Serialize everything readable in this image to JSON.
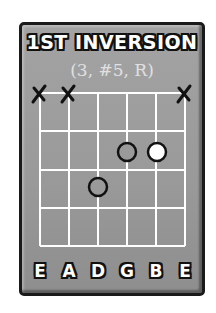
{
  "title": "1ST INVERSION",
  "subtitle": "(3, #5, R)",
  "colors": {
    "card": "#9e9e9e",
    "border": "#1a1a1a",
    "grid": "#ffffff",
    "root_fill": "#ffffff",
    "note_fill": "#9e9e9e"
  },
  "diagram": {
    "strings": [
      "E",
      "A",
      "D",
      "G",
      "B",
      "E"
    ],
    "frets_shown": 4,
    "muted_strings": [
      1,
      2,
      6
    ],
    "notes": [
      {
        "string": 3,
        "fret": 2,
        "role": "#5",
        "filled": false
      },
      {
        "string": 4,
        "fret": 1,
        "role": "3",
        "filled": false
      },
      {
        "string": 5,
        "fret": 1,
        "role": "R",
        "filled": true
      }
    ]
  },
  "string_labels": [
    "E",
    "A",
    "D",
    "G",
    "B",
    "E"
  ]
}
